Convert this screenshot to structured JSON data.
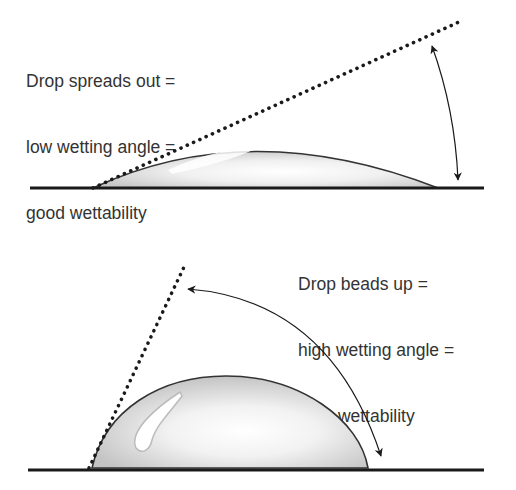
{
  "panels": [
    {
      "id": "low-angle",
      "label_lines": [
        "Drop spreads out =",
        "low wetting angle =",
        "good wettability"
      ]
    },
    {
      "id": "high-angle",
      "label_lines": [
        "Drop beads up =",
        "high wetting angle =",
        "poor wettability"
      ]
    }
  ],
  "colors": {
    "text": "#333333",
    "line": "#1a1a1a",
    "drop_fill": "#d4d4d4",
    "drop_highlight": "#ffffff"
  }
}
